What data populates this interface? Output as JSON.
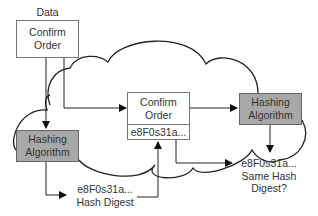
{
  "diagram": {
    "data_label": "Data",
    "sender_message": {
      "line1": "Confirm",
      "line2": "Order"
    },
    "sender_hashing": {
      "line1": "Hashing",
      "line2": "Algorithm"
    },
    "sender_digest": {
      "line1": "e8F0s31a...",
      "line2": "Hash Digest"
    },
    "transmitted_message": {
      "line1": "Confirm",
      "line2": "Order",
      "digest": "e8F0s31a..."
    },
    "receiver_hashing": {
      "line1": "Hashing",
      "line2": "Algorithm"
    },
    "receiver_digest": {
      "line1": "e8F0s31a...",
      "line2": "Same Hash",
      "line3": "Digest?"
    },
    "colors": {
      "algorithm_fill": "#a8a8a8",
      "stroke": "#222222",
      "box_border": "#777777"
    }
  }
}
